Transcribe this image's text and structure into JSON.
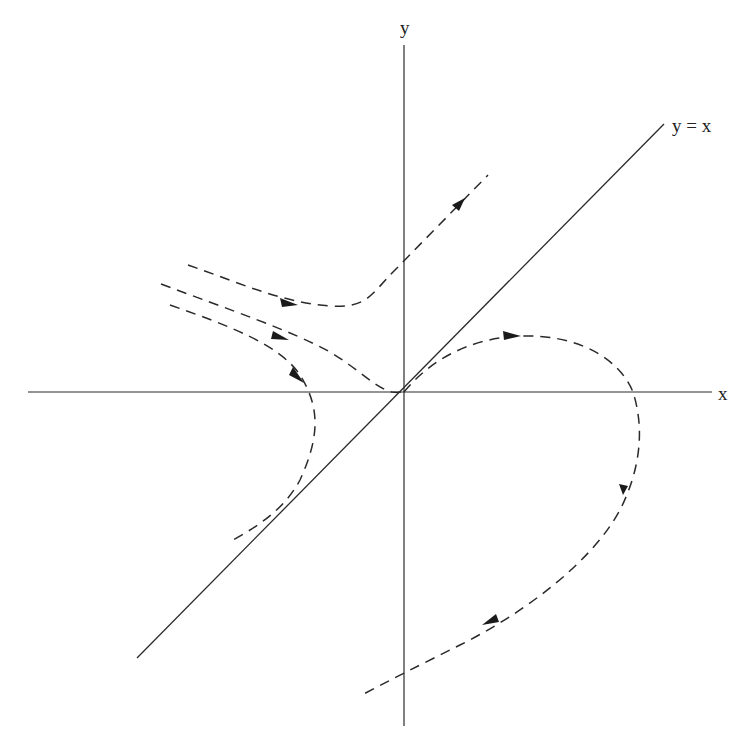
{
  "diagram": {
    "type": "phase-portrait",
    "labels": {
      "y_axis": "y",
      "x_axis": "x",
      "diagonal": "y = x"
    },
    "elements": {
      "axes": [
        "x-axis",
        "y-axis"
      ],
      "reference_line": "y = x",
      "trajectories": [
        {
          "name": "upper-hyperbolic-trajectory",
          "style": "dashed",
          "direction": "left-to-upper-right"
        },
        {
          "name": "separatrix-into-origin",
          "style": "dashed",
          "direction": "toward-origin"
        },
        {
          "name": "left-turning-trajectory",
          "style": "dashed",
          "direction": "turns-down-left"
        },
        {
          "name": "homoclinic-loop-trajectory",
          "style": "dashed",
          "direction": "from-origin-around-and-down-left"
        }
      ]
    },
    "colors": {
      "line": "#2a2a2a",
      "background": "#ffffff"
    }
  }
}
